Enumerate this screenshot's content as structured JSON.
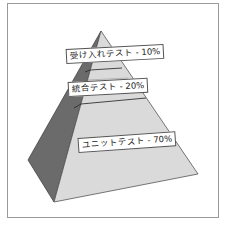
{
  "diagram": {
    "type": "test-pyramid",
    "tiers": [
      {
        "label": "受け入れテスト - 10%",
        "name": "受け入れテスト",
        "percent": 10
      },
      {
        "label": "統合テスト - 20%",
        "name": "統合テスト",
        "percent": 20
      },
      {
        "label": "ユニットテスト - 70%",
        "name": "ユニットテスト",
        "percent": 70
      }
    ],
    "colors": {
      "front_face": "#d9d9d9",
      "side_face": "#6e6e6e",
      "edge": "#444444",
      "label_bg": "#ffffff"
    }
  }
}
